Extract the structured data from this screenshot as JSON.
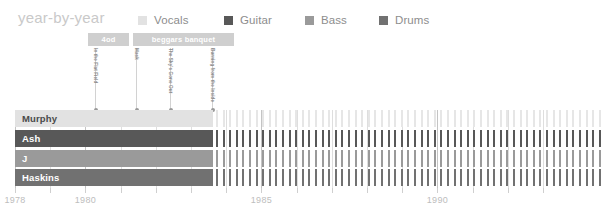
{
  "header": {
    "title": "year-by-year"
  },
  "legend": {
    "items": [
      {
        "label": "Vocals",
        "color": "#e2e2e2",
        "x": 0
      },
      {
        "label": "Guitar",
        "color": "#585858",
        "x": 86
      },
      {
        "label": "Bass",
        "color": "#9a9a9a",
        "x": 167
      },
      {
        "label": "Drums",
        "color": "#717171",
        "x": 241
      }
    ]
  },
  "albums": {
    "bars": [
      {
        "label": "4od",
        "x": 88,
        "width": 41,
        "color": "#cfcfcf"
      },
      {
        "label": "beggars banquet",
        "x": 133,
        "width": 101,
        "color": "#cfcfcf"
      }
    ]
  },
  "markers": {
    "items": [
      {
        "label": "In the Flat Field",
        "x": 95
      },
      {
        "label": "Mask",
        "x": 136
      },
      {
        "label": "The Sky's Gone Out",
        "x": 170
      },
      {
        "label": "Burning from the Inside",
        "x": 212
      }
    ]
  },
  "chart_data": {
    "type": "bar",
    "title": "year-by-year",
    "xlabel": "",
    "ylabel": "",
    "grid": true,
    "legend_position": "top",
    "xlim": [
      1978,
      1993.2
    ],
    "x_ticks": [
      1978,
      1979,
      1980,
      1981,
      1982,
      1983,
      1984,
      1985,
      1986,
      1987,
      1988,
      1989,
      1990,
      1991,
      1992,
      1993
    ],
    "x_tick_labels": [
      "1978",
      "",
      "1980",
      "",
      "",
      "",
      "",
      "1985",
      "",
      "",
      "",
      "",
      "1990",
      "",
      "",
      ""
    ],
    "major_ticks": [
      1978,
      1980,
      1985,
      1990
    ],
    "px_per_year": 35.2,
    "x_origin_px": 15,
    "solid_end_px": 213,
    "categories": [
      "Murphy",
      "Ash",
      "J",
      "Haskins"
    ],
    "series": [
      {
        "name": "Murphy",
        "role": "Vocals",
        "color": "#e2e2e2",
        "active_start": 1978.1,
        "active_end": 1983.6,
        "dashed_end": 1993.2
      },
      {
        "name": "Ash",
        "role": "Guitar",
        "color": "#585858",
        "active_start": 1978.1,
        "active_end": 1983.6,
        "dashed_end": 1993.2
      },
      {
        "name": "J",
        "role": "Bass",
        "color": "#9a9a9a",
        "active_start": 1978.1,
        "active_end": 1983.6,
        "dashed_end": 1993.2
      },
      {
        "name": "Haskins",
        "role": "Drums",
        "color": "#717171",
        "active_start": 1978.1,
        "active_end": 1983.6,
        "dashed_end": 1993.2
      }
    ]
  },
  "rows": [
    {
      "label": "Murphy",
      "color": "#e2e2e2",
      "label_color": "#4a4a4a",
      "stripe_color": "#e6e6e6",
      "y": 0,
      "solid_x": 15,
      "solid_w": 198,
      "stripe_x": 216,
      "stripe_w": 386,
      "stripe_gap": 6.6
    },
    {
      "label": "Ash",
      "color": "#585858",
      "label_color": "#ffffff",
      "stripe_color": "#585858",
      "y": 20,
      "solid_x": 15,
      "solid_w": 198,
      "stripe_x": 216,
      "stripe_w": 386,
      "stripe_gap": 6.6
    },
    {
      "label": "J",
      "color": "#9a9a9a",
      "label_color": "#ffffff",
      "stripe_color": "#9a9a9a",
      "y": 40,
      "solid_x": 15,
      "solid_w": 198,
      "stripe_x": 216,
      "stripe_w": 386,
      "stripe_gap": 6.6
    },
    {
      "label": "Haskins",
      "color": "#717171",
      "label_color": "#ffffff",
      "stripe_color": "#717171",
      "y": 59,
      "solid_x": 15,
      "solid_w": 198,
      "stripe_x": 216,
      "stripe_w": 386,
      "stripe_gap": 6.6
    }
  ],
  "axis": {
    "ticks": [
      {
        "label": "1978",
        "x": 15,
        "major": true
      },
      {
        "label": "",
        "x": 50.2,
        "major": false
      },
      {
        "label": "1980",
        "x": 85.4,
        "major": true
      },
      {
        "label": "",
        "x": 120.6,
        "major": false
      },
      {
        "label": "",
        "x": 155.8,
        "major": false
      },
      {
        "label": "",
        "x": 191,
        "major": false
      },
      {
        "label": "",
        "x": 226.2,
        "major": false
      },
      {
        "label": "1985",
        "x": 261.4,
        "major": true
      },
      {
        "label": "",
        "x": 296.6,
        "major": false
      },
      {
        "label": "",
        "x": 331.8,
        "major": false
      },
      {
        "label": "",
        "x": 367,
        "major": false
      },
      {
        "label": "",
        "x": 402.2,
        "major": false
      },
      {
        "label": "1990",
        "x": 437.4,
        "major": true
      },
      {
        "label": "",
        "x": 472.6,
        "major": false
      },
      {
        "label": "",
        "x": 507.8,
        "major": false
      },
      {
        "label": "",
        "x": 543,
        "major": false
      }
    ]
  }
}
